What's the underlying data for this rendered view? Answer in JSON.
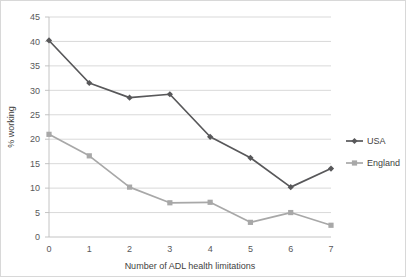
{
  "chart_data": {
    "type": "line",
    "title": "",
    "xlabel": "Number of ADL health limitations",
    "ylabel": "% working",
    "x": [
      0,
      1,
      2,
      3,
      4,
      5,
      6,
      7
    ],
    "categories": [
      "0",
      "1",
      "2",
      "3",
      "4",
      "5",
      "6",
      "7"
    ],
    "xlim": [
      0,
      7
    ],
    "ylim": [
      0,
      45
    ],
    "ytick_labels": [
      "0",
      "5",
      "10",
      "15",
      "20",
      "25",
      "30",
      "35",
      "40",
      "45"
    ],
    "yticks": [
      0,
      5,
      10,
      15,
      20,
      25,
      30,
      35,
      40,
      45
    ],
    "grid": "horizontal",
    "legend_position": "right",
    "series": [
      {
        "name": "USA",
        "values": [
          40.2,
          31.5,
          28.5,
          29.2,
          20.5,
          16.2,
          10.2,
          14.0
        ],
        "color": "#58585a",
        "marker": "diamond"
      },
      {
        "name": "England",
        "values": [
          21.0,
          16.6,
          10.2,
          7.0,
          7.1,
          3.0,
          5.0,
          2.4
        ],
        "color": "#a8a8a8",
        "marker": "square"
      }
    ]
  },
  "legend": {
    "items": [
      {
        "label": "USA",
        "color": "#58585a",
        "marker": "diamond"
      },
      {
        "label": "England",
        "color": "#a8a8a8",
        "marker": "square"
      }
    ]
  },
  "colors": {
    "background": "#ffffff",
    "gridline": "#c9c9c9",
    "axis": "#bdbdbd",
    "text": "#58585a",
    "usa": "#58585a",
    "england": "#a8a8a8"
  }
}
